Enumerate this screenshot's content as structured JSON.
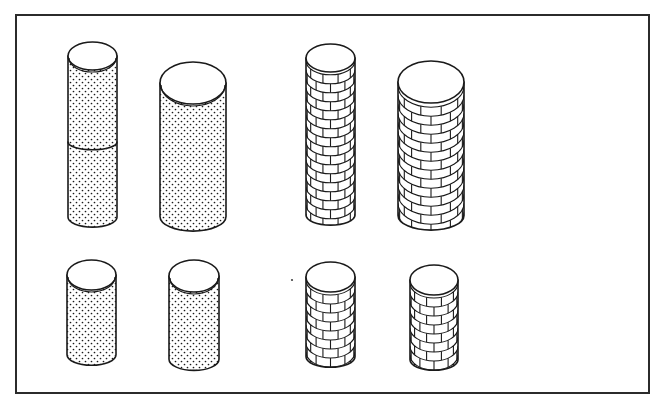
{
  "figure": {
    "title": "Cylinders with stippled and brick textures",
    "background": "#ffffff",
    "ink": "#1a1a1a",
    "frame": {
      "x": 16,
      "y": 15,
      "width": 633,
      "height": 378
    }
  },
  "groups": [
    {
      "name": "stippled",
      "texture": "dots",
      "count": 4
    },
    {
      "name": "brick",
      "texture": "bricks",
      "count": 4
    }
  ],
  "cylinders": [
    {
      "id": "dot-tall",
      "texture": "dots",
      "x": 68,
      "w": 49,
      "cy": 56,
      "ry": 14,
      "bottom": 225,
      "seam": 142
    },
    {
      "id": "dot-large",
      "texture": "dots",
      "x": 160,
      "w": 66,
      "cy": 83,
      "ry": 21,
      "bottom": 228,
      "seam": null
    },
    {
      "id": "brick-tall",
      "texture": "bricks",
      "x": 306,
      "w": 49,
      "cy": 58,
      "ry": 14,
      "bottom": 223,
      "seam": null
    },
    {
      "id": "brick-large",
      "texture": "bricks",
      "x": 398,
      "w": 66,
      "cy": 82,
      "ry": 21,
      "bottom": 227,
      "seam": null
    },
    {
      "id": "dot-small-1",
      "texture": "dots",
      "x": 67,
      "w": 49,
      "cy": 275,
      "ry": 15,
      "bottom": 363,
      "seam": null
    },
    {
      "id": "dot-small-2",
      "texture": "dots",
      "x": 169,
      "w": 50,
      "cy": 276,
      "ry": 16,
      "bottom": 368,
      "seam": null
    },
    {
      "id": "brick-small-1",
      "texture": "bricks",
      "x": 306,
      "w": 49,
      "cy": 277,
      "ry": 15,
      "bottom": 365,
      "seam": null
    },
    {
      "id": "brick-small-2",
      "texture": "bricks",
      "x": 410,
      "w": 48,
      "cy": 280,
      "ry": 15,
      "bottom": 368,
      "seam": null
    }
  ],
  "stray_mark": {
    "x": 292,
    "y": 280
  }
}
